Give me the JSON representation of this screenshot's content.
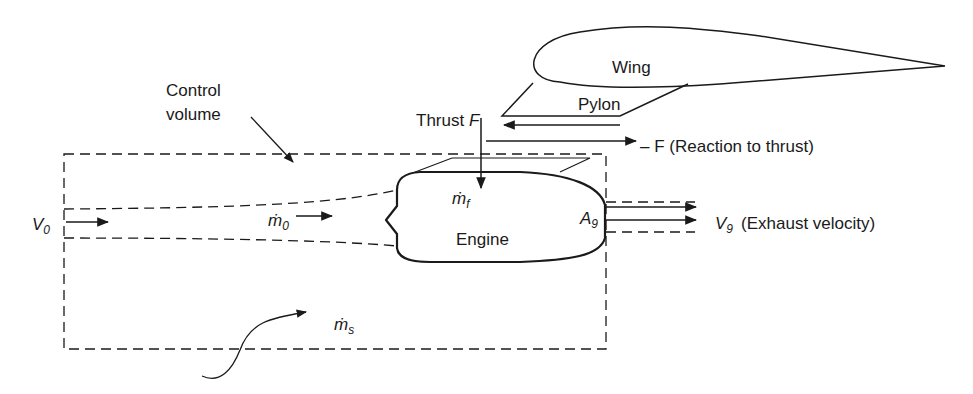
{
  "diagram": {
    "labels": {
      "wing": "Wing",
      "pylon": "Pylon",
      "thrust_prefix": "Thrust ",
      "thrust_symbol": "F",
      "reaction": "– F (Reaction to thrust)",
      "control_volume_line1": "Control",
      "control_volume_line2": "volume",
      "v0_symbol": "V",
      "v0_sub": "0",
      "m0_symbol": "ṁ",
      "m0_sub": "0",
      "mf_symbol": "ṁ",
      "mf_sub": "f",
      "engine": "Engine",
      "a9_symbol": "A",
      "a9_sub": "9",
      "v9_symbol": "V",
      "v9_sub": "9",
      "exhaust": "(Exhaust velocity)",
      "ms_symbol": "ṁ",
      "ms_sub": "s"
    },
    "colors": {
      "stroke": "#1a1a1a",
      "background": "#ffffff"
    }
  }
}
